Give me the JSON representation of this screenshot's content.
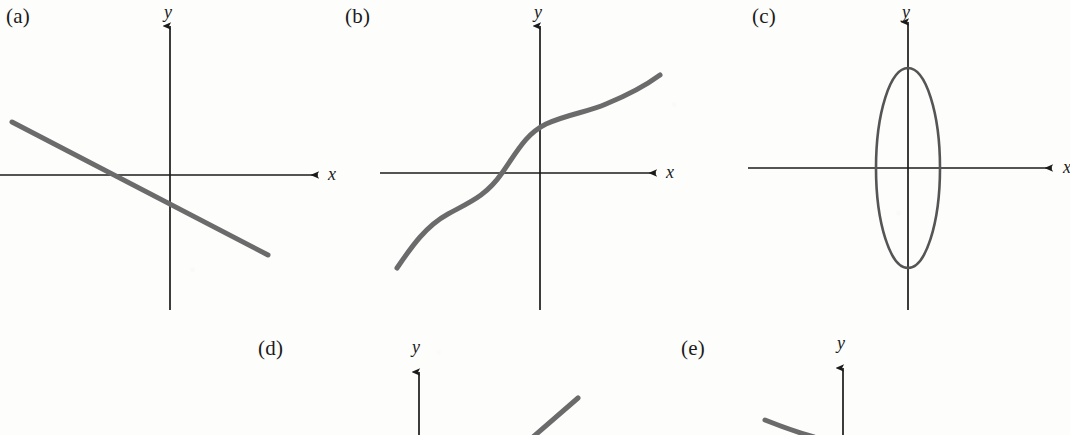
{
  "figure": {
    "background_color": "#fdfdfc",
    "axis_color": "#1b1b1b",
    "curve_color": "#6b6b6b",
    "ellipse_color": "#555555",
    "width": 1070,
    "height": 435
  },
  "panels": [
    {
      "id": "a",
      "label": "(a)",
      "label_x": 6,
      "label_y": 4,
      "graph_type": "line",
      "description": "Straight line with negative slope crossing the x-axis left of the origin",
      "axes": {
        "origin_x": 170,
        "origin_y": 175,
        "x_axis": {
          "x1": 0,
          "x2": 322,
          "label": "x",
          "label_x": 328,
          "label_y": 164,
          "arrow": "right"
        },
        "y_axis": {
          "y1": 22,
          "y2": 310,
          "label": "y",
          "label_x": 164,
          "label_y": 2,
          "arrow": "up"
        }
      },
      "curve": {
        "kind": "segment",
        "points": [
          [
            12,
            122
          ],
          [
            268,
            255
          ]
        ],
        "stroke_width": 5,
        "x_intercept": 112,
        "y_intercept": 206,
        "slope": -0.52
      }
    },
    {
      "id": "b",
      "label": "(b)",
      "label_x": 345,
      "label_y": 4,
      "graph_type": "cubic",
      "description": "Increasing S-shaped cubic curve rising from lower left to upper right, crossing the x-axis left of the origin",
      "axes": {
        "origin_x": 540,
        "origin_y": 173,
        "x_axis": {
          "x1": 380,
          "x2": 660,
          "label": "x",
          "label_x": 668,
          "label_y": 162,
          "arrow": "right"
        },
        "y_axis": {
          "y1": 22,
          "y2": 310,
          "label": "y",
          "label_x": 534,
          "label_y": 2,
          "arrow": "up"
        }
      },
      "curve": {
        "kind": "path",
        "path": "M 397 268 C 412 246 426 226 448 214 C 470 202 486 196 502 173 C 518 150 526 134 546 124 C 568 114 588 112 606 104 C 628 95 645 86 660 75",
        "stroke_width": 5,
        "x_intercept": 502
      }
    },
    {
      "id": "c",
      "label": "(c)",
      "label_x": 752,
      "label_y": 4,
      "graph_type": "ellipse",
      "description": "Vertically elongated ellipse centered at the origin",
      "axes": {
        "origin_x": 908,
        "origin_y": 168,
        "x_axis": {
          "x1": 748,
          "x2": 1056,
          "label": "x",
          "label_x": 1063,
          "label_y": 157,
          "arrow": "right"
        },
        "y_axis": {
          "y1": 18,
          "y2": 310,
          "label": "y",
          "label_x": 902,
          "label_y": 2,
          "arrow": "up"
        }
      },
      "curve": {
        "kind": "ellipse",
        "cx": 908,
        "cy": 168,
        "rx": 32,
        "ry": 100,
        "stroke_width": 2.6
      }
    },
    {
      "id": "d",
      "label": "(d)",
      "label_x": 258,
      "label_y": 336,
      "graph_type": "line",
      "description": "Partially visible panel cut off by the bottom edge: vertical y-axis with a rising diagonal line segment to its right",
      "clipped": true,
      "axes": {
        "origin_x": 419,
        "origin_y": 435,
        "y_axis": {
          "y1": 368,
          "y2": 435,
          "label": "y",
          "label_x": 412,
          "label_y": 337,
          "arrow": "up"
        }
      },
      "curve": {
        "kind": "segment",
        "points": [
          [
            533,
            435
          ],
          [
            578,
            398
          ]
        ],
        "stroke_width": 5
      }
    },
    {
      "id": "e",
      "label": "(e)",
      "label_x": 681,
      "label_y": 336,
      "graph_type": "curve",
      "description": "Partially visible panel cut off by the bottom edge: vertical y-axis with a curve fragment descending to the left",
      "clipped": true,
      "axes": {
        "origin_x": 843,
        "origin_y": 435,
        "y_axis": {
          "y1": 364,
          "y2": 435,
          "label": "y",
          "label_x": 837,
          "label_y": 333,
          "arrow": "up"
        }
      },
      "curve": {
        "kind": "path",
        "path": "M 765 420 C 785 428 800 433 812 435",
        "stroke_width": 5
      }
    }
  ]
}
